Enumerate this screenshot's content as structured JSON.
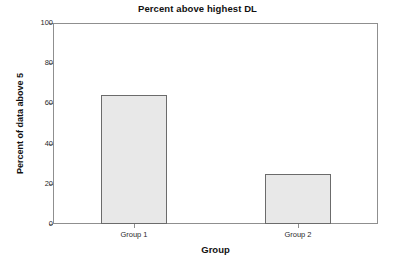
{
  "chart_data": {
    "type": "bar",
    "title": "Percent above highest DL",
    "xlabel": "Group",
    "ylabel": "Percent of data above 5",
    "categories": [
      "Group 1",
      "Group 2"
    ],
    "values": [
      64,
      25
    ],
    "ylim": [
      0,
      100
    ],
    "yticks": [
      0,
      20,
      40,
      60,
      80,
      100
    ],
    "ytick_labels": [
      "0",
      "20",
      "40",
      "60",
      "80",
      "100"
    ],
    "grid": false,
    "legend": false,
    "bar_fill_color": "#e8e8e8",
    "bar_edge_color": "#6b6b6b",
    "axis_color": "#8f8f8f",
    "background_color": "#ffffff"
  }
}
